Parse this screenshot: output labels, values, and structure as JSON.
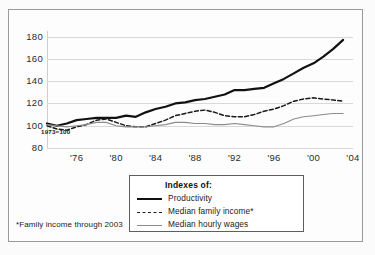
{
  "figure": {
    "base_note": "1973=100",
    "footnote": "*Family income through 2003"
  },
  "legend": {
    "title": "Indexes of:",
    "items": [
      {
        "label": "Productivity",
        "style": "solid-thick",
        "color": "#111111"
      },
      {
        "label": "Median family income*",
        "style": "dashed",
        "color": "#1a1a1a"
      },
      {
        "label": "Median hourly wages",
        "style": "solid-thin",
        "color": "#8c8c8c"
      }
    ]
  },
  "chart_data": {
    "type": "line",
    "title": "",
    "subtitle": "",
    "xlabel": "",
    "ylabel": "",
    "base_note": "1973=100",
    "footnote": "*Family income through 2003",
    "grid": true,
    "legend_position": "bottom-center",
    "xlim": [
      1973,
      2004
    ],
    "ylim": [
      80,
      185
    ],
    "yticks": [
      80,
      100,
      120,
      140,
      160,
      180
    ],
    "ytick_labels": [
      "80",
      "100",
      "120",
      "140",
      "160",
      "180"
    ],
    "xticks": [
      1976,
      1980,
      1984,
      1988,
      1992,
      1996,
      2000,
      2004
    ],
    "xtick_labels": [
      "'76",
      "'80",
      "'84",
      "'88",
      "'92",
      "'96",
      "'00",
      "'04"
    ],
    "x": [
      1973,
      1974,
      1975,
      1976,
      1977,
      1978,
      1979,
      1980,
      1981,
      1982,
      1983,
      1984,
      1985,
      1986,
      1987,
      1988,
      1989,
      1990,
      1991,
      1992,
      1993,
      1994,
      1995,
      1996,
      1997,
      1998,
      1999,
      2000,
      2001,
      2002,
      2003
    ],
    "series": [
      {
        "name": "Productivity",
        "style": "solid-thick",
        "color": "#111111",
        "values": [
          102,
          100,
          102,
          105,
          106,
          107,
          107,
          107,
          109,
          108,
          112,
          115,
          117,
          120,
          121,
          123,
          124,
          126,
          128,
          132,
          132,
          133,
          134,
          138,
          142,
          147,
          152,
          156,
          162,
          169,
          177
        ]
      },
      {
        "name": "Median family income*",
        "style": "dashed",
        "color": "#1a1a1a",
        "values": [
          100,
          97,
          96,
          99,
          101,
          105,
          106,
          103,
          100,
          99,
          99,
          102,
          105,
          109,
          111,
          113,
          114,
          112,
          109,
          108,
          108,
          110,
          113,
          115,
          118,
          122,
          124,
          125,
          124,
          123,
          122
        ]
      },
      {
        "name": "Median hourly wages",
        "style": "solid-thin",
        "color": "#8c8c8c",
        "values": [
          101,
          100,
          99,
          100,
          101,
          103,
          103,
          100,
          99,
          99,
          99,
          100,
          101,
          103,
          103,
          102,
          102,
          101,
          101,
          102,
          101,
          100,
          99,
          99,
          102,
          106,
          108,
          109,
          110,
          111,
          111
        ]
      }
    ]
  }
}
